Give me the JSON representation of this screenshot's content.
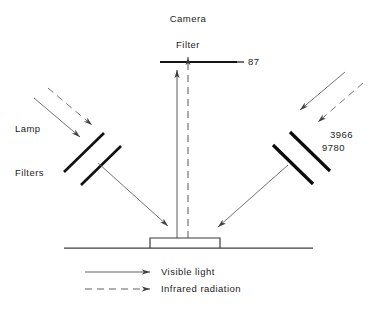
{
  "diagram": {
    "title_labels": {
      "camera": "Camera",
      "filter": "Filter",
      "filter_number": "87",
      "lamp": "Lamp",
      "filters": "Filters",
      "right_filter_number_top": "3966",
      "right_filter_number_bottom": "9780"
    },
    "legend": {
      "visible_light": "Visible light",
      "infrared_radiation": "Infrared radiation"
    },
    "colors": {
      "ink": "#1c1c1c",
      "ray": "#555555",
      "filter_bar": "#111111",
      "background": "#ffffff"
    },
    "elements": {
      "camera_filter_bar": "horizontal-bar",
      "left_filter_bars": 2,
      "right_filter_bars": 2,
      "specimen": "sample-stage-box",
      "baseline": "table-surface-line"
    }
  }
}
